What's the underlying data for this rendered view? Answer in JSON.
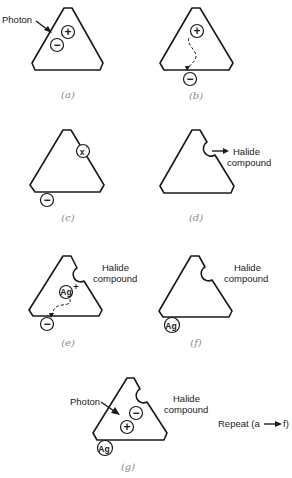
{
  "figure": {
    "type": "latent-image-formation-diagram",
    "panels": [
      {
        "id": "a",
        "caption": "(a)",
        "labels": {
          "photon": "Photon"
        },
        "particles": [
          {
            "symbol": "+",
            "kind": "hole"
          },
          {
            "symbol": "−",
            "kind": "electron"
          }
        ],
        "description": "Photon strikes crystal, creating electron-hole pair"
      },
      {
        "id": "b",
        "caption": "(b)",
        "particles": [
          {
            "symbol": "+",
            "kind": "hole"
          },
          {
            "symbol": "−",
            "kind": "electron"
          }
        ],
        "description": "Electron migrates (dashed path) to the crystal surface"
      },
      {
        "id": "c",
        "caption": "(c)",
        "particles": [
          {
            "symbol": "x°",
            "kind": "halide-atom"
          },
          {
            "symbol": "−",
            "kind": "electron"
          }
        ],
        "description": "Hole neutralizes a halide ion at the surface"
      },
      {
        "id": "d",
        "caption": "(d)",
        "labels": {
          "halide_line1": "Halide",
          "halide_line2": "compound"
        },
        "description": "Halide atom leaves the crystal as halide compound"
      },
      {
        "id": "e",
        "caption": "(e)",
        "labels": {
          "halide_line1": "Halide",
          "halide_line2": "compound"
        },
        "particles": [
          {
            "symbol": "Ag",
            "superscript": "+",
            "kind": "silver-ion"
          },
          {
            "symbol": "−",
            "kind": "electron"
          }
        ],
        "description": "Silver ion migrates toward trapped electron"
      },
      {
        "id": "f",
        "caption": "(f)",
        "labels": {
          "halide_line1": "Halide",
          "halide_line2": "compound"
        },
        "particles": [
          {
            "symbol": "Ag",
            "superscript": "°",
            "kind": "silver-atom"
          }
        ],
        "description": "Neutral silver atom formed at surface"
      },
      {
        "id": "g",
        "caption": "(g)",
        "labels": {
          "photon": "Photon",
          "halide_line1": "Halide",
          "halide_line2": "compound",
          "repeat": "Repeat (a → f)",
          "repeat_prefix": "Repeat (a",
          "repeat_suffix": "f)"
        },
        "particles": [
          {
            "symbol": "−",
            "kind": "electron"
          },
          {
            "symbol": "+",
            "kind": "hole"
          },
          {
            "symbol": "Ag",
            "superscript": "°",
            "kind": "silver-atom"
          }
        ],
        "description": "Another photon starts the cycle again"
      }
    ],
    "colors": {
      "line": "#1a1a1a",
      "caption": "#8a8a8a",
      "background": "#ffffff"
    }
  }
}
